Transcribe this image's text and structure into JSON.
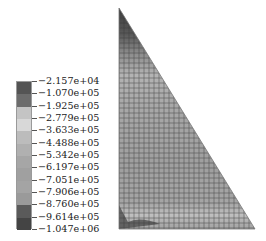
{
  "chart_data": {
    "type": "heatmap",
    "title": "",
    "legend": {
      "position": "left",
      "labels": [
        "-2.157e+04",
        "-1.070e+05",
        "-1.925e+05",
        "-2.779e+05",
        "-3.633e+05",
        "-4.488e+05",
        "-5.342e+05",
        "-6.197e+05",
        "-7.051e+05",
        "-7.906e+05",
        "-8.760e+05",
        "-9.614e+05",
        "-1.047e+06"
      ],
      "band_colors": [
        "#545454",
        "#6c6c6c",
        "#c4c4c4",
        "#d8d8d8",
        "#bcbcbc",
        "#b0b0b0",
        "#a6a6a6",
        "#a0a0a0",
        "#a4a4a4",
        "#9a9a9a",
        "#5a5a5a",
        "#444444"
      ],
      "min": -1047000.0,
      "max": -21570.0
    },
    "domain": {
      "shape": "right-triangle",
      "apex": [
        119,
        8
      ],
      "bottom_left": [
        119,
        229
      ],
      "bottom_right": [
        255,
        229
      ]
    },
    "mesh": {
      "cell_px": 5
    }
  }
}
